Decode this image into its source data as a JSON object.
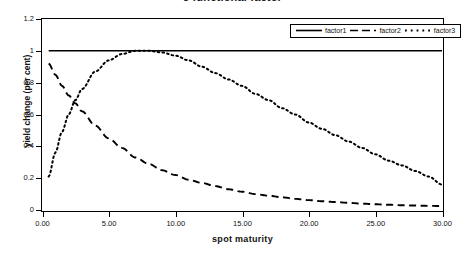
{
  "chart_data": {
    "type": "line",
    "title": "3 functional factor",
    "xlabel": "spot maturity",
    "ylabel": "yield change (per cent)",
    "xlim": [
      0,
      30
    ],
    "ylim": [
      0,
      1.2
    ],
    "grid": false,
    "legend_position": "top-right",
    "xticks": [
      "0.00",
      "5.00",
      "10.00",
      "15.00",
      "20.00",
      "25.00",
      "30.00"
    ],
    "xtick_values": [
      0,
      5,
      10,
      15,
      20,
      25,
      30
    ],
    "yticks": [
      "0",
      "0.2",
      "0.4",
      "0.6",
      "0.8",
      "1",
      "1.2"
    ],
    "ytick_values": [
      0,
      0.2,
      0.4,
      0.6,
      0.8,
      1,
      1.2
    ],
    "x": [
      0.5,
      1,
      1.5,
      2,
      2.5,
      3,
      4,
      5,
      6,
      7,
      8,
      9,
      10,
      11,
      12,
      13,
      14,
      15,
      16,
      17,
      18,
      19,
      20,
      21,
      22,
      23,
      24,
      25,
      26,
      27,
      28,
      29,
      30
    ],
    "series": [
      {
        "name": "factor1",
        "style": "solid",
        "color": "#000000",
        "values": [
          1.0,
          1.0,
          1.0,
          1.0,
          1.0,
          1.0,
          1.0,
          1.0,
          1.0,
          1.0,
          1.0,
          1.0,
          1.0,
          1.0,
          1.0,
          1.0,
          1.0,
          1.0,
          1.0,
          1.0,
          1.0,
          1.0,
          1.0,
          1.0,
          1.0,
          1.0,
          1.0,
          1.0,
          1.0,
          1.0,
          1.0,
          1.0,
          1.0
        ]
      },
      {
        "name": "factor2",
        "style": "dashed",
        "color": "#000000",
        "values": [
          0.92,
          0.85,
          0.78,
          0.72,
          0.67,
          0.62,
          0.53,
          0.45,
          0.39,
          0.33,
          0.29,
          0.25,
          0.22,
          0.19,
          0.17,
          0.15,
          0.13,
          0.115,
          0.1,
          0.09,
          0.08,
          0.07,
          0.062,
          0.055,
          0.05,
          0.045,
          0.04,
          0.036,
          0.033,
          0.03,
          0.028,
          0.026,
          0.025
        ]
      },
      {
        "name": "factor3",
        "style": "dotted",
        "color": "#000000",
        "values": [
          0.21,
          0.36,
          0.49,
          0.6,
          0.69,
          0.76,
          0.87,
          0.94,
          0.98,
          1.0,
          1.0,
          0.99,
          0.97,
          0.94,
          0.9,
          0.86,
          0.82,
          0.78,
          0.73,
          0.69,
          0.64,
          0.6,
          0.55,
          0.51,
          0.47,
          0.43,
          0.39,
          0.35,
          0.31,
          0.28,
          0.245,
          0.21,
          0.16
        ]
      }
    ]
  }
}
